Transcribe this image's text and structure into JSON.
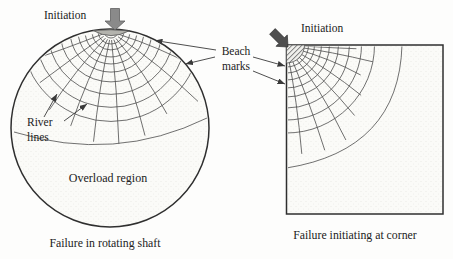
{
  "figure": {
    "left_panel": {
      "initiation_label": "Initiation",
      "river_lines_label_line1": "River",
      "river_lines_label_line2": "lines",
      "overload_region_label": "Overload region",
      "caption": "Failure in rotating shaft"
    },
    "right_panel": {
      "initiation_label": "Initiation",
      "caption": "Failure initiating at corner"
    },
    "beach_marks_label": {
      "line1": "Beach",
      "line2": "marks"
    },
    "icons": {
      "left_load_arrow": "block-arrow-down-icon",
      "right_load_arrow": "block-arrow-diagonal-icon",
      "leader_arrows": "arrowhead-icon"
    },
    "colors": {
      "outline_ink": "#2f2f2f",
      "detail_line": "#4d4d4d",
      "leader_line": "#3a3a3a",
      "initiation_site_fill": "#b3b3ad",
      "load_arrow_fill": "#8a8a8a",
      "corner_arrow_fill": "#4f4f4f",
      "surface_texture_dot": "#e9e9e3",
      "hatch_line": "#777777",
      "background": "#fdfdfc",
      "text": "#222222"
    }
  }
}
